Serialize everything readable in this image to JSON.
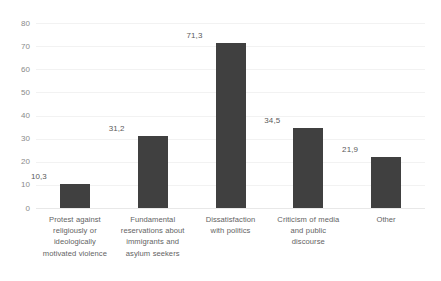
{
  "chart_data": {
    "type": "bar",
    "title": "",
    "subtitle": "",
    "xlabel": "",
    "ylabel": "",
    "ylim": [
      0,
      80
    ],
    "ytick_step": 10,
    "yticks": [
      "80",
      "70",
      "60",
      "50",
      "40",
      "30",
      "20",
      "10",
      "0"
    ],
    "grid": true,
    "legend": false,
    "legend_position": "none",
    "decimal_separator": ",",
    "categories": [
      "Protest against religiously or ideologically motivated violence",
      "Fundamental reservations about immigrants and asylum seekers",
      "Dissatisfaction with politics",
      "Criticism of media and public discourse",
      "Other"
    ],
    "category_lines": [
      [
        "Protest against",
        "religiously or",
        "ideologically",
        "motivated violence"
      ],
      [
        "Fundamental",
        "reservations about",
        "immigrants and",
        "asylum seekers"
      ],
      [
        "Dissatisfaction",
        "with politics"
      ],
      [
        "Criticism of media",
        "and public",
        "discourse"
      ],
      [
        "Other"
      ]
    ],
    "values": [
      10.3,
      31.2,
      71.3,
      34.5,
      21.9
    ],
    "value_labels": [
      "10,3",
      "31,2",
      "71,3",
      "34,5",
      "21,9"
    ],
    "colors": {
      "bar": "#404040",
      "gridline": "#f2f2f2",
      "baseline": "#e8e8e8",
      "tick_text": "#8a8a8a",
      "value_text": "#5a5a5a",
      "category_text": "#636363",
      "background": "#ffffff"
    }
  }
}
